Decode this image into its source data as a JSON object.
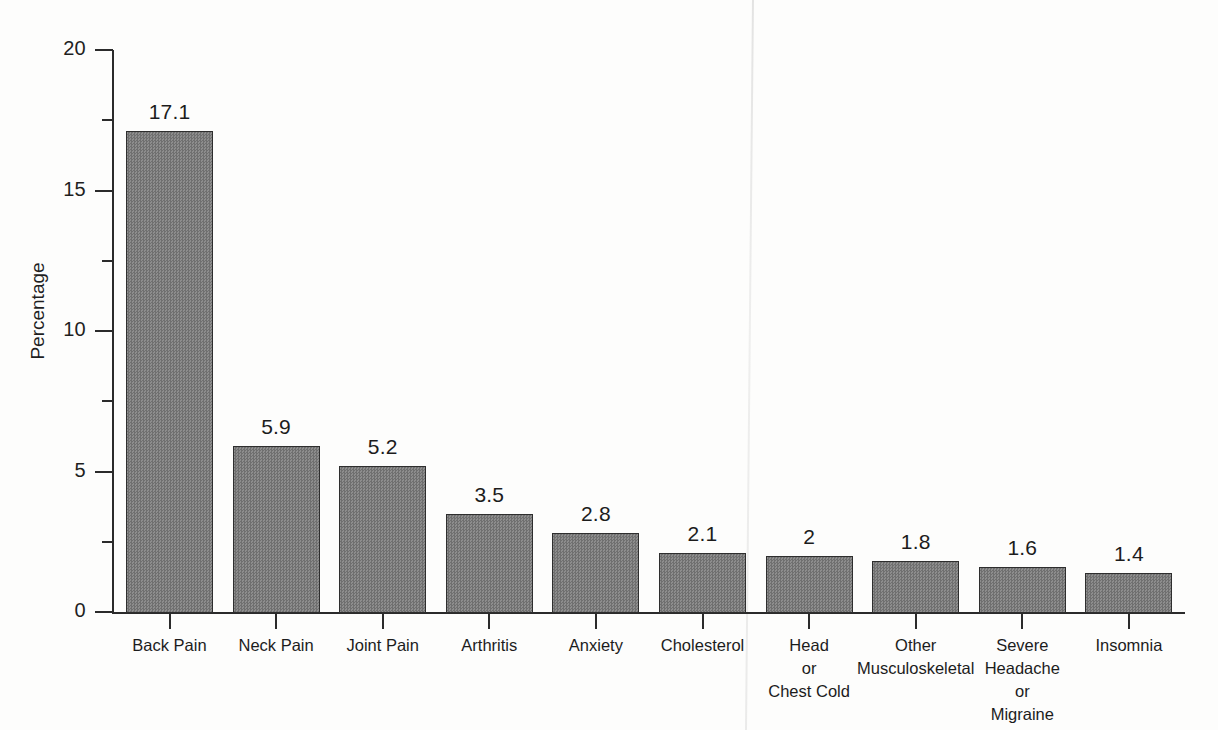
{
  "chart_data": {
    "type": "bar",
    "title": "",
    "subtitle": "",
    "xlabel": "",
    "ylabel": "Percentage",
    "ylim": [
      0,
      20
    ],
    "grid": false,
    "legend": null,
    "y_ticks": [
      {
        "value": 0,
        "label": "0",
        "major": true
      },
      {
        "value": 2.5,
        "label": "",
        "major": false
      },
      {
        "value": 5,
        "label": "5",
        "major": true
      },
      {
        "value": 7.5,
        "label": "",
        "major": false
      },
      {
        "value": 10,
        "label": "10",
        "major": true
      },
      {
        "value": 12.5,
        "label": "",
        "major": false
      },
      {
        "value": 15,
        "label": "15",
        "major": true
      },
      {
        "value": 17.5,
        "label": "",
        "major": false
      },
      {
        "value": 20,
        "label": "20",
        "major": true
      }
    ],
    "categories": [
      "Back Pain",
      "Neck Pain",
      "Joint Pain",
      "Arthritis",
      "Anxiety",
      "Cholesterol",
      "Head\nor\nChest Cold",
      "Other\nMusculoskeletal",
      "Severe\nHeadache\nor\nMigraine",
      "Insomnia"
    ],
    "values": [
      17.1,
      5.9,
      5.2,
      3.5,
      2.8,
      2.1,
      2,
      1.8,
      1.6,
      1.4
    ],
    "value_labels": [
      "17.1",
      "5.9",
      "5.2",
      "3.5",
      "2.8",
      "2.1",
      "2",
      "1.8",
      "1.6",
      "1.4"
    ],
    "bar_fill_color": "#7d7d7d",
    "bar_edge_color": "#2e2e2e",
    "axis_color": "#2b2b2b",
    "background_color": "#fdfdfc"
  }
}
